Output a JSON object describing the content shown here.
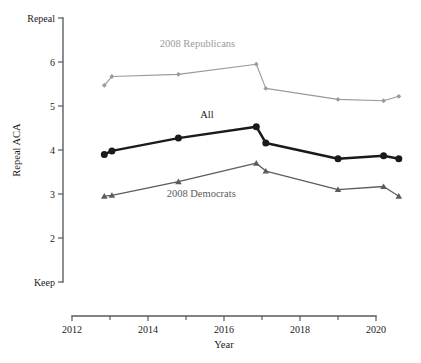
{
  "chart_data": {
    "type": "line",
    "title": "",
    "xlabel": "Year",
    "ylabel": "Repeal ACA",
    "xlim": [
      2011.6,
      2021.2
    ],
    "ylim": [
      1,
      7
    ],
    "grid": false,
    "legend_position": "inline-annotations",
    "x_ticks": [
      "2012",
      "2014",
      "2016",
      "2018",
      "2020"
    ],
    "x_tick_values": [
      2012,
      2014,
      2016,
      2018,
      2020
    ],
    "y_ticks": [
      "Keep",
      "2",
      "3",
      "4",
      "5",
      "6",
      "Repeal"
    ],
    "y_tick_values": [
      1,
      2,
      3,
      4,
      5,
      6,
      7
    ],
    "y_axis_low_label": "Keep",
    "y_axis_high_label": "Repeal",
    "series": [
      {
        "name": "2008 Republicans",
        "color": "#9a9a9a",
        "marker": "diamond",
        "x": [
          2012.85,
          2013.05,
          2014.8,
          2016.85,
          2017.1,
          2019.0,
          2020.2,
          2020.6
        ],
        "values": [
          5.47,
          5.67,
          5.72,
          5.95,
          5.4,
          5.15,
          5.12,
          5.22
        ]
      },
      {
        "name": "All",
        "color": "#1a1a1a",
        "marker": "circle",
        "x": [
          2012.85,
          2013.05,
          2014.8,
          2016.85,
          2017.1,
          2019.0,
          2020.2,
          2020.6
        ],
        "values": [
          3.9,
          3.98,
          4.27,
          4.53,
          4.16,
          3.8,
          3.87,
          3.8
        ]
      },
      {
        "name": "2008 Democrats",
        "color": "#5c5c5c",
        "marker": "triangle",
        "x": [
          2012.85,
          2013.05,
          2014.8,
          2016.85,
          2017.1,
          2019.0,
          2020.2,
          2020.6
        ],
        "values": [
          2.95,
          2.97,
          3.28,
          3.7,
          3.52,
          3.1,
          3.17,
          2.95
        ]
      }
    ],
    "annotations": [
      {
        "text": "2008 Republicans",
        "x": 2015.3,
        "y": 6.35,
        "color": "#9a9a9a"
      },
      {
        "text": "All",
        "x": 2015.55,
        "y": 4.72,
        "color": "#1a1a1a"
      },
      {
        "text": "2008 Democrats",
        "x": 2015.4,
        "y": 2.93,
        "color": "#5c5c5c"
      }
    ]
  }
}
